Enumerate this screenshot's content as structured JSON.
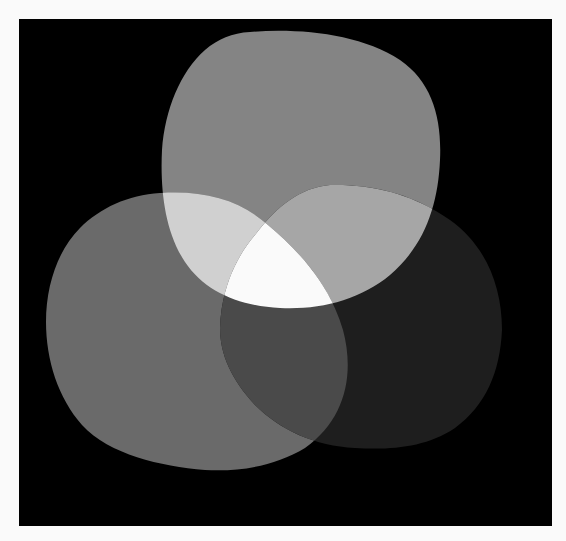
{
  "figure": {
    "type": "three-set overlapping light blobs (additive Venn)",
    "background_color": "#000000",
    "page_color": "#fafafa",
    "sets": [
      {
        "id": "top",
        "label": "",
        "color": "#848484"
      },
      {
        "id": "left",
        "label": "",
        "color": "#6a6a6a"
      },
      {
        "id": "right",
        "label": "",
        "color": "#1e1e1e"
      }
    ],
    "overlaps": {
      "top_left": "#d0d0d0",
      "top_right": "#a6a6a6",
      "left_right": "#4a4a4a",
      "all_three": "#fafafa"
    }
  }
}
